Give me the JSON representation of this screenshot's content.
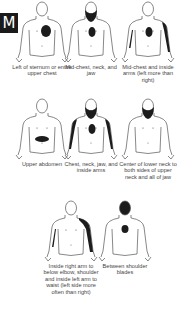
{
  "badge": {
    "label": "M",
    "color": "#1a1a1a"
  },
  "figures": [
    {
      "caption": "Left of sternum or entire upper chest",
      "regions": [
        "chest-left"
      ]
    },
    {
      "caption": "Mid-chest, neck, and jaw",
      "regions": [
        "chest-mid",
        "neck-jaw"
      ]
    },
    {
      "caption": "Mid-chest and inside arms (left more than right)",
      "regions": [
        "chest-mid",
        "arm-left",
        "arm-right-thin"
      ]
    },
    {
      "caption": "Upper abdomen",
      "regions": [
        "abdomen"
      ]
    },
    {
      "caption": "Chest, neck, jaw, and inside arms",
      "regions": [
        "chest-mid",
        "neck-jaw",
        "arm-left",
        "arm-right"
      ]
    },
    {
      "caption": "Center of lower neck to both sides of upper neck and all of jaw",
      "regions": [
        "neck-jaw"
      ]
    },
    {
      "caption": "Inside right arm to below elbow, shoulder and inside left arm to waist (left side more often than right)",
      "regions": [
        "arm-left-shoulder",
        "arm-right-thin"
      ]
    },
    {
      "caption": "Between shoulder blades",
      "regions": [
        "back-between"
      ],
      "view": "back"
    }
  ],
  "colors": {
    "pain": "#1c1c1c",
    "outline": "#555555"
  }
}
